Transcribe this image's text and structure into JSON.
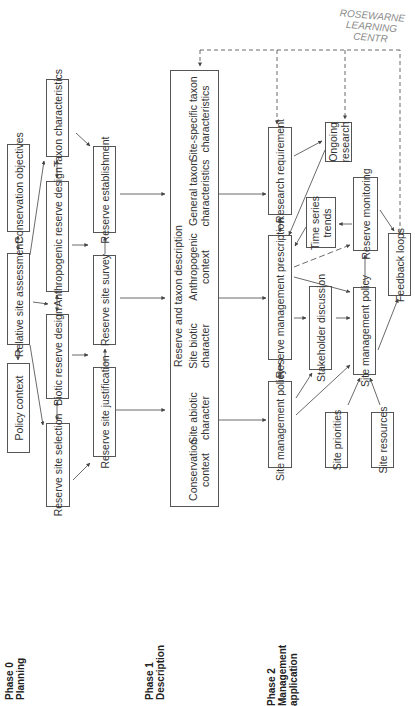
{
  "watermark": {
    "line1": "ROSEWARNE",
    "line2": "LEARNING CENTR"
  },
  "phases": [
    {
      "id": "phase0",
      "line1": "Phase 0",
      "line2": "Planning",
      "line3": ""
    },
    {
      "id": "phase1",
      "line1": "Phase 1",
      "line2": "Description",
      "line3": ""
    },
    {
      "id": "phase2",
      "line1": "Phase 2",
      "line2": "Management",
      "line3": "application"
    }
  ],
  "phase0": {
    "conservation_objectives": "Conservation objectives",
    "relative_site_assessment": "Relative site assessment",
    "policy_context": "Policy context",
    "taxon_characteristics": "Taxon characteristics",
    "anthropogenic_reserve_design": "Anthropogenic reserve design",
    "biotic_reserve_design": "Biotic reserve design",
    "reserve_site_selection": "Reserve site selection",
    "reserve_establishment": "Reserve establishment",
    "reserve_site_survey": "Reserve site survey",
    "reserve_site_justification": "Reserve site justification"
  },
  "phase1": {
    "title": "Reserve and taxon description",
    "items": [
      {
        "line1": "Conservation",
        "line2": "context"
      },
      {
        "line1": "Site abiotic",
        "line2": "character"
      },
      {
        "line1": "Site biotic",
        "line2": "character"
      },
      {
        "line1": "Anthropogenic",
        "line2": "context"
      },
      {
        "line1": "General taxon",
        "line2": "characteristics"
      },
      {
        "line1": "Site-specific taxon",
        "line2": "characteristics"
      }
    ]
  },
  "phase2": {
    "research_requirement": "Research requirement",
    "ongoing_research": {
      "line1": "Ongoing",
      "line2": "research"
    },
    "reserve_management_prescription": "Reserve management prescription",
    "time_series_trends": {
      "line1": "Time series",
      "line2": "trends"
    },
    "reserve_monitoring": "Reserve monitoring",
    "feedback_loops": "Feedback loops",
    "stakeholder_discussion": "Stakeholder discussion",
    "site_management_policy_right": "Site management policy",
    "site_management_policy_left": "Site management policy",
    "site_priorities": "Site priorities",
    "site_resources": "Site resources"
  },
  "colors": {
    "line": "#444444",
    "box_border": "#555555",
    "text": "#333333",
    "watermark": "#8a8a8a"
  }
}
